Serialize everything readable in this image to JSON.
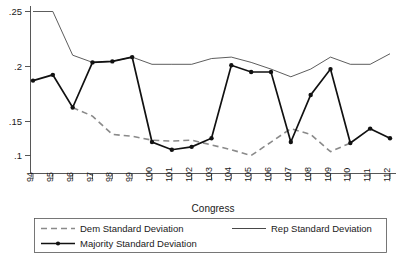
{
  "chart_data": {
    "type": "line",
    "title": "",
    "xlabel": "Congress",
    "ylabel": "",
    "categories": [
      "94",
      "95",
      "96",
      "97",
      "98",
      "99",
      "100",
      "101",
      "102",
      "103",
      "104",
      "105",
      "106",
      "107",
      "108",
      "109",
      "110",
      "111",
      "112"
    ],
    "x": [
      94,
      95,
      96,
      97,
      98,
      99,
      100,
      101,
      102,
      103,
      104,
      105,
      106,
      107,
      108,
      109,
      110,
      111,
      112
    ],
    "xlim": [
      94,
      112
    ],
    "ylim": [
      0.09,
      0.255
    ],
    "yticks": [
      0.1,
      0.15,
      0.2,
      0.25
    ],
    "ytick_labels": [
      ".1",
      ".15",
      ".2",
      ".25"
    ],
    "grid": false,
    "legend_position": "below-axes",
    "series": [
      {
        "name": "Dem Standard Deviation",
        "style": "dashed",
        "color": "#8a8a8a",
        "values": [
          null,
          null,
          0.15,
          0.141,
          0.122,
          0.12,
          0.116,
          0.115,
          0.116,
          0.111,
          0.106,
          0.1,
          0.114,
          0.128,
          0.122,
          0.104,
          0.113,
          null,
          null
        ]
      },
      {
        "name": "Rep Standard Deviation",
        "style": "solid-thin",
        "color": "#333333",
        "values": [
          0.25,
          0.25,
          0.2045,
          0.197,
          0.198,
          0.2025,
          0.195,
          0.195,
          0.195,
          0.201,
          0.2025,
          0.197,
          0.19,
          0.182,
          0.19,
          0.2025,
          0.195,
          0.195,
          0.206
        ]
      },
      {
        "name": "Majority Standard Deviation",
        "style": "solid-thick-marker",
        "color": "#111111",
        "values": [
          0.178,
          0.184,
          0.15,
          0.197,
          0.198,
          0.2025,
          0.114,
          0.106,
          0.109,
          0.118,
          0.194,
          0.187,
          0.187,
          0.114,
          0.163,
          0.19,
          0.113,
          0.128,
          0.118
        ]
      }
    ]
  },
  "axes": {
    "x_title": "Congress",
    "y_tick_labels": [
      ".25",
      ".2",
      ".15",
      ".1"
    ],
    "x_tick_labels": [
      "94",
      "95",
      "96",
      "97",
      "98",
      "99",
      "100",
      "101",
      "102",
      "103",
      "104",
      "105",
      "106",
      "107",
      "108",
      "109",
      "110",
      "111",
      "112"
    ]
  },
  "legend": {
    "entries": [
      {
        "label": "Dem Standard Deviation",
        "style": "dashed"
      },
      {
        "label": "Rep Standard Deviation",
        "style": "solid-thin"
      },
      {
        "label": "Majority Standard Deviation",
        "style": "solid-thick-marker"
      }
    ]
  }
}
